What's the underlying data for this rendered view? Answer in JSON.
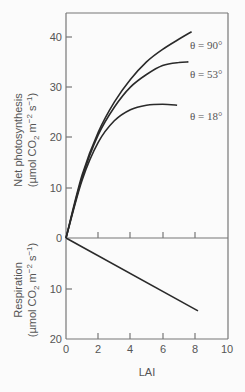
{
  "chart_data": [
    {
      "type": "line",
      "panel": "top",
      "title": "",
      "xlabel": "LAI",
      "ylabel": "Net photosynthesis",
      "ylabel_units": "(µmol CO2 m^-2 s^-1)",
      "ylabel_line1": "Net photosynthesis",
      "ylabel_line2_prefix": "(µmol CO",
      "ylabel_line2_sub": "2",
      "ylabel_line2_mid": " m",
      "ylabel_line2_sup1": "−2",
      "ylabel_line2_mid2": " s",
      "ylabel_line2_sup2": "−1",
      "ylabel_line2_suffix": ")",
      "xlim": [
        0,
        10
      ],
      "ylim": [
        0,
        45
      ],
      "yticks": [
        0,
        10,
        20,
        30,
        40
      ],
      "grid": false,
      "legend": "inline labels at right",
      "series": [
        {
          "name": "θ = 90°",
          "x": [
            0,
            1,
            2,
            3,
            4,
            5,
            6,
            7,
            7.8
          ],
          "values": [
            0,
            12.5,
            21,
            27,
            31.5,
            35,
            37.5,
            39.5,
            41
          ]
        },
        {
          "name": "θ = 53°",
          "x": [
            0,
            1,
            2,
            3,
            4,
            5,
            6,
            7,
            7.6
          ],
          "values": [
            0,
            12,
            20.5,
            26,
            30,
            32.5,
            34.3,
            34.9,
            35
          ]
        },
        {
          "name": "θ = 18°",
          "x": [
            0,
            1,
            2,
            3,
            4,
            5,
            6,
            6.9
          ],
          "values": [
            0,
            11.5,
            19,
            23.3,
            25.5,
            26.4,
            26.6,
            26.4
          ]
        }
      ]
    },
    {
      "type": "line",
      "panel": "bottom",
      "title": "",
      "xlabel": "LAI",
      "ylabel": "Respiration",
      "ylabel_units": "(µmol CO2 m^-2 s^-1)",
      "xlim": [
        0,
        10
      ],
      "ylim": [
        0,
        20
      ],
      "y_inverted": true,
      "yticks": [
        0,
        10,
        20
      ],
      "xticks": [
        0,
        2,
        4,
        6,
        8,
        10
      ],
      "grid": false,
      "series": [
        {
          "name": "Respiration",
          "x": [
            0,
            8.2
          ],
          "values": [
            0,
            14.5
          ]
        }
      ]
    }
  ],
  "axes": {
    "x_title": "LAI",
    "x_ticks": [
      "0",
      "2",
      "4",
      "6",
      "8",
      "10"
    ],
    "top_y_ticks": [
      "40",
      "30",
      "20",
      "10",
      "0"
    ],
    "bottom_y_ticks": [
      "10",
      "20"
    ],
    "top_title_line1": "Net photosynthesis",
    "bottom_title_line1": "Respiration",
    "units_prefix": "(µmol CO",
    "units_sub": "2",
    "units_m": " m",
    "units_sup1": "−2",
    "units_s": " s",
    "units_sup2": "−1",
    "units_suffix": ")"
  },
  "labels": {
    "theta90": "θ = 90°",
    "theta53": "θ = 53°",
    "theta18": "θ = 18°"
  },
  "colors": {
    "curve": "#2a2a2a",
    "axis": "#666666",
    "text": "#555555",
    "background": "#fbfbfb"
  }
}
